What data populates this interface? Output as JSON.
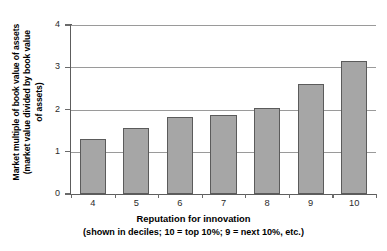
{
  "chart_data": {
    "type": "bar",
    "title": "",
    "subtitle": "",
    "categories": [
      "4",
      "5",
      "6",
      "7",
      "8",
      "9",
      "10"
    ],
    "values": [
      1.3,
      1.57,
      1.82,
      1.87,
      2.03,
      2.6,
      3.16
    ],
    "series": [
      {
        "name": "Market multiple of book value of assets",
        "values": [
          1.3,
          1.57,
          1.82,
          1.87,
          2.03,
          2.6,
          3.16
        ]
      }
    ],
    "xlabel": "Reputation for innovation",
    "xlabel_note": "(shown in deciles; 10 = top 10%; 9 = next 10%, etc.)",
    "ylabel": "Market multiple of book value of assets (market value divided by book value of assets)",
    "ylabel_lines": [
      "Market multiple of book value of assets",
      "(market value divided by book value",
      "of assets)"
    ],
    "ylim": [
      0,
      4
    ],
    "yticks": [
      0,
      1,
      2,
      3,
      4
    ],
    "ytick_labels": [
      "0",
      "1",
      "2",
      "3",
      "4"
    ],
    "grid": "horizontal",
    "legend": "none",
    "bar_color": "#a6a6a6",
    "bar_border_color": "#5b5b5b",
    "gridline_color": "#9a9a9a",
    "axis_color": "#5d5d5d",
    "background_color": "#ffffff"
  }
}
